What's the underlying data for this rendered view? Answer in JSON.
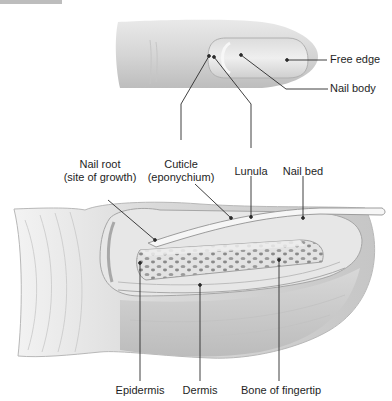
{
  "figure": {
    "top_view_labels": {
      "free_edge": "Free edge",
      "nail_body": "Nail body"
    },
    "section_labels": {
      "nail_root_line1": "Nail root",
      "nail_root_line2": "(site of growth)",
      "cuticle_line1": "Cuticle",
      "cuticle_line2": "(eponychium)",
      "lunula": "Lunula",
      "nail_bed": "Nail bed",
      "epidermis": "Epidermis",
      "dermis": "Dermis",
      "bone": "Bone of fingertip"
    },
    "colors": {
      "skin_light": "#ececec",
      "skin_mid": "#d4d4d4",
      "skin_dark": "#b5b5b5",
      "leader_line": "#2a2a2a",
      "bone_pores": "#8a8a8a"
    }
  }
}
